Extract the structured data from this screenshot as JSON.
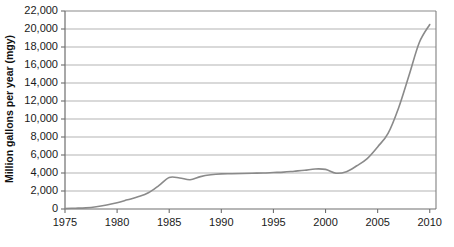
{
  "chart_data": {
    "type": "line",
    "title": "",
    "subtitle": "",
    "xlabel": "",
    "ylabel": "Million gallons per year (mgy)",
    "xlim": [
      1975,
      2010.6
    ],
    "ylim": [
      0,
      22000
    ],
    "grid": true,
    "legend": false,
    "legend_position": "none",
    "line_color": "#8a8a8a",
    "grid_color": "#aaaaaa",
    "frame_color": "#808080",
    "background_color": "#ffffff",
    "y_tick_labels": [
      "0",
      "2,000",
      "4,000",
      "6,000",
      "8,000",
      "10,000",
      "12,000",
      "14,000",
      "16,000",
      "18,000",
      "20,000",
      "22,000"
    ],
    "y_tick_values": [
      0,
      2000,
      4000,
      6000,
      8000,
      10000,
      12000,
      14000,
      16000,
      18000,
      20000,
      22000
    ],
    "x_tick_labels": [
      "1975",
      "1980",
      "1985",
      "1990",
      "1995",
      "2000",
      "2005",
      "2010"
    ],
    "x_tick_values": [
      1975,
      1980,
      1985,
      1990,
      1995,
      2000,
      2005,
      2010
    ],
    "series": [
      {
        "name": "Production",
        "x": [
          1975,
          1976,
          1977,
          1978,
          1979,
          1980,
          1981,
          1982,
          1983,
          1984,
          1985,
          1986,
          1987,
          1988,
          1989,
          1990,
          1991,
          1992,
          1993,
          1994,
          1995,
          1996,
          1997,
          1998,
          1999,
          2000,
          2001,
          2002,
          2003,
          2004,
          2005,
          2006,
          2007,
          2008,
          2009,
          2010
        ],
        "values": [
          60,
          90,
          130,
          250,
          450,
          700,
          1020,
          1350,
          1800,
          2600,
          3500,
          3450,
          3250,
          3600,
          3800,
          3900,
          3920,
          3950,
          3980,
          4000,
          4050,
          4100,
          4200,
          4300,
          4450,
          4400,
          3980,
          4150,
          4800,
          5600,
          6900,
          8400,
          11200,
          14800,
          18500,
          20500
        ]
      }
    ],
    "annotations": []
  }
}
